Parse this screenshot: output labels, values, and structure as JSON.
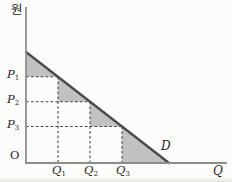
{
  "figure": {
    "y_axis_unit": "원",
    "x_axis_label": "Q",
    "origin_label": "O",
    "demand_curve_label": "D",
    "prices": [
      {
        "base": "P",
        "sub": "1"
      },
      {
        "base": "P",
        "sub": "2"
      },
      {
        "base": "P",
        "sub": "3"
      }
    ],
    "quantities": [
      {
        "base": "Q",
        "sub": "1"
      },
      {
        "base": "Q",
        "sub": "2"
      },
      {
        "base": "Q",
        "sub": "3"
      }
    ]
  },
  "colors": {
    "background": "#fcfcfb",
    "axis": "#8d8d8d",
    "demand_line": "#4a4a4a",
    "dashed_line": "#3f3f3f",
    "shade": "#c1c1c1"
  }
}
